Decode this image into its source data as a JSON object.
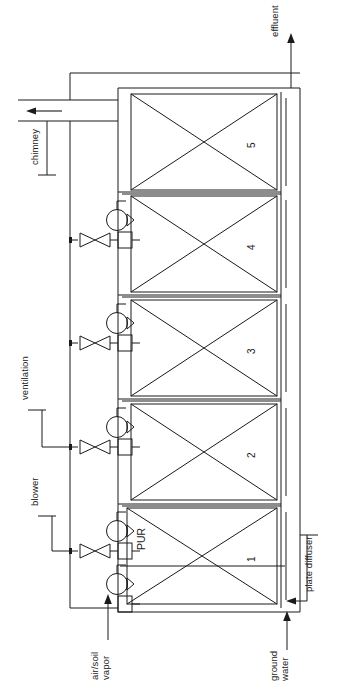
{
  "diagram": {
    "orientation": "rotated-90-ccw",
    "background_color": "#ffffff",
    "line_color": "#1a1a1a",
    "labels": {
      "effluent": "effluent",
      "chimney": "chimney",
      "ventilation": "ventilation",
      "blower": "blower",
      "air_soil_vapor_line1": "air/soil",
      "air_soil_vapor_line2": "vapor",
      "ground_water_line1": "ground",
      "ground_water_line2": "water",
      "plate_diffuser": "plate diffuser",
      "pur": "PUR"
    },
    "tanks": [
      {
        "id": "tank-1",
        "number": "1",
        "inner_label": "PUR"
      },
      {
        "id": "tank-2",
        "number": "2",
        "inner_label": ""
      },
      {
        "id": "tank-3",
        "number": "3",
        "inner_label": ""
      },
      {
        "id": "tank-4",
        "number": "4",
        "inner_label": ""
      },
      {
        "id": "tank-5",
        "number": "5",
        "inner_label": ""
      }
    ],
    "blowers": [
      {
        "id": "blower-vapor",
        "has_valve": false
      },
      {
        "id": "blower-1",
        "has_valve": true
      },
      {
        "id": "blower-2",
        "has_valve": true
      },
      {
        "id": "blower-3",
        "has_valve": true
      },
      {
        "id": "blower-4",
        "has_valve": true
      }
    ],
    "flow_arrows": [
      {
        "id": "arrow-effluent",
        "direction": "up",
        "label": "effluent"
      },
      {
        "id": "arrow-chimney",
        "direction": "left",
        "label": "chimney"
      },
      {
        "id": "arrow-air-soil-vapor",
        "direction": "up",
        "label": "air/soil vapor"
      },
      {
        "id": "arrow-ground-water",
        "direction": "up",
        "label": "ground water"
      },
      {
        "id": "arrow-plate-diffuser",
        "direction": "left",
        "label": "plate diffuser"
      }
    ]
  }
}
